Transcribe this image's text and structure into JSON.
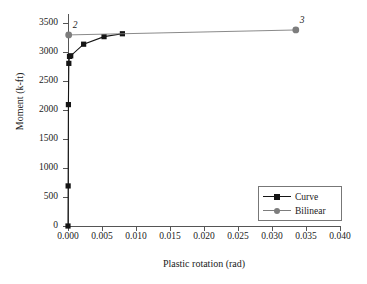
{
  "chart_data": {
    "type": "line",
    "title": "",
    "xlabel": "Plastic rotation (rad)",
    "ylabel": "Moment (k-ft)",
    "xlim": [
      0.0,
      0.04
    ],
    "ylim": [
      0,
      3650
    ],
    "xticks": [
      0.0,
      0.005,
      0.01,
      0.015,
      0.02,
      0.025,
      0.03,
      0.035,
      0.04
    ],
    "xtick_labels": [
      "0.000",
      "0.005",
      "0.010",
      "0.015",
      "0.020",
      "0.025",
      "0.030",
      "0.035",
      "0.040"
    ],
    "yticks": [
      0,
      500,
      1000,
      1500,
      2000,
      2500,
      3000,
      3500
    ],
    "ytick_labels": [
      "0",
      "500",
      "1000",
      "1500",
      "2000",
      "2500",
      "3000",
      "3500"
    ],
    "grid": false,
    "legend_position": "lower right",
    "series": [
      {
        "name": "Curve",
        "color": "#151515",
        "marker": "square",
        "x": [
          0.0,
          2e-05,
          6e-05,
          0.00012,
          0.00022,
          0.0004,
          0.0023,
          0.0053,
          0.008
        ],
        "y": [
          0,
          690,
          2090,
          2800,
          2920,
          2930,
          3130,
          3260,
          3310
        ]
      },
      {
        "name": "Bilinear",
        "color": "#7d7d7d",
        "marker": "circle",
        "x": [
          0.0001,
          0.0335
        ],
        "y": [
          3290,
          3375
        ],
        "point_labels": [
          "2",
          "3"
        ]
      }
    ],
    "annotations": [
      {
        "text": "2",
        "x": 0.0001,
        "y": 3290
      },
      {
        "text": "3",
        "x": 0.0335,
        "y": 3375
      }
    ]
  },
  "legend": {
    "items": [
      {
        "label": "Curve",
        "marker": "square",
        "color": "#151515"
      },
      {
        "label": "Bilinear",
        "marker": "circle",
        "color": "#7d7d7d"
      }
    ]
  }
}
